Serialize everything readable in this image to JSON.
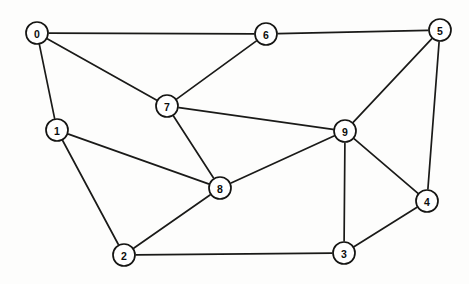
{
  "figure": {
    "kind": "undirected-graph-diagram",
    "width": 469,
    "height": 284,
    "background_color": "#fdfdfc",
    "node_fill_color": "#ffffff",
    "node_stroke_color": "#141412",
    "edge_color": "#1a1a18",
    "node_radius": 11
  },
  "graph": {
    "node_count": 10,
    "edge_count": 17,
    "nodes": [
      {
        "id": "0",
        "label": "0",
        "x": 37,
        "y": 33,
        "degree": 3
      },
      {
        "id": "1",
        "label": "1",
        "x": 57,
        "y": 130,
        "degree": 3
      },
      {
        "id": "2",
        "label": "2",
        "x": 124,
        "y": 255,
        "degree": 3
      },
      {
        "id": "3",
        "label": "3",
        "x": 344,
        "y": 253,
        "degree": 3
      },
      {
        "id": "4",
        "label": "4",
        "x": 427,
        "y": 201,
        "degree": 3
      },
      {
        "id": "5",
        "label": "5",
        "x": 440,
        "y": 30,
        "degree": 3
      },
      {
        "id": "6",
        "label": "6",
        "x": 266,
        "y": 34,
        "degree": 3
      },
      {
        "id": "7",
        "label": "7",
        "x": 167,
        "y": 106,
        "degree": 4
      },
      {
        "id": "8",
        "label": "8",
        "x": 220,
        "y": 188,
        "degree": 4
      },
      {
        "id": "9",
        "label": "9",
        "x": 345,
        "y": 131,
        "degree": 5
      }
    ],
    "edges": [
      {
        "id": "e-0-6",
        "source": "0",
        "target": "6"
      },
      {
        "id": "e-0-7",
        "source": "0",
        "target": "7"
      },
      {
        "id": "e-0-1",
        "source": "0",
        "target": "1"
      },
      {
        "id": "e-1-8",
        "source": "1",
        "target": "8"
      },
      {
        "id": "e-1-2",
        "source": "1",
        "target": "2"
      },
      {
        "id": "e-2-8",
        "source": "2",
        "target": "8"
      },
      {
        "id": "e-2-3",
        "source": "2",
        "target": "3"
      },
      {
        "id": "e-3-9",
        "source": "3",
        "target": "9"
      },
      {
        "id": "e-3-4",
        "source": "3",
        "target": "4"
      },
      {
        "id": "e-4-5",
        "source": "4",
        "target": "5"
      },
      {
        "id": "e-4-9",
        "source": "4",
        "target": "9"
      },
      {
        "id": "e-5-6",
        "source": "5",
        "target": "6"
      },
      {
        "id": "e-5-9",
        "source": "5",
        "target": "9"
      },
      {
        "id": "e-6-7",
        "source": "6",
        "target": "7"
      },
      {
        "id": "e-7-8",
        "source": "7",
        "target": "8"
      },
      {
        "id": "e-7-9",
        "source": "7",
        "target": "9"
      },
      {
        "id": "e-8-9",
        "source": "8",
        "target": "9"
      }
    ]
  }
}
